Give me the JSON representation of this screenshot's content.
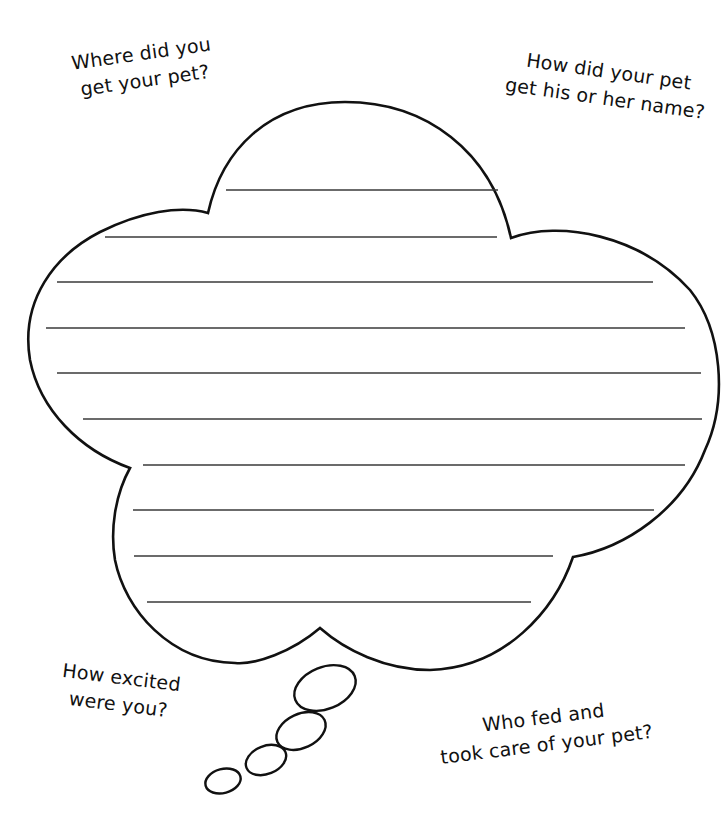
{
  "worksheet": {
    "prompts": {
      "top_left": {
        "line1": "Where did you",
        "line2": "get your pet?"
      },
      "top_right": {
        "line1": "How did your pet",
        "line2": "get his or her name?"
      },
      "bottom_left": {
        "line1": "How excited",
        "line2": "were you?"
      },
      "bottom_right": {
        "line1": "Who fed and",
        "line2": "took care of your pet?"
      }
    },
    "thought_cloud": {
      "writing_lines": 10,
      "stroke_color": "#111111",
      "line_color": "#3a3a3a",
      "trail_bubbles": 4
    }
  }
}
